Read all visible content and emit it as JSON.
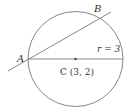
{
  "diagram": {
    "type": "geometry",
    "labels": {
      "point_a": "A",
      "point_b": "B",
      "center": "C (3, 2)",
      "radius": "r = 3"
    },
    "center_coords": [
      3,
      2
    ],
    "radius_value": 3,
    "colors": {
      "stroke": "#7a7a7a",
      "text": "#333333",
      "background": "#ffffff"
    }
  }
}
